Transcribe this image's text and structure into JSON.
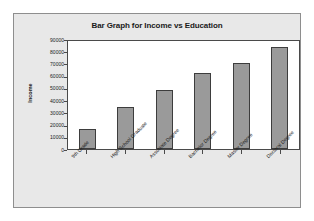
{
  "chart_data": {
    "type": "bar",
    "title": "Bar Graph for Income vs Education",
    "xlabel": "",
    "ylabel": "Income",
    "categories": [
      "9th Grade",
      "High School Graduate",
      "Associate Degree",
      "Bachelor Degree",
      "Master Degree",
      "Doctoral Degree"
    ],
    "values": [
      16000,
      34000,
      48500,
      62000,
      70000,
      83500
    ],
    "ylim": [
      0,
      90000
    ],
    "ytick_values": [
      90000,
      80000,
      70000,
      60000,
      50000,
      40000,
      30000,
      20000,
      10000,
      0
    ],
    "ytick_labels": [
      "90000",
      "80000",
      "70000",
      "60000",
      "50000",
      "40000",
      "30000",
      "20000",
      "10000",
      "0"
    ],
    "grid": false,
    "legend": false,
    "bar_color": "#9a9a9a",
    "bar_border_color": "#3d3d3d",
    "plot_background": "#ffffff",
    "panel_background": "#e8e8e8",
    "axis_color": "#4a4a4a",
    "text_color": "#1a1a1a"
  }
}
